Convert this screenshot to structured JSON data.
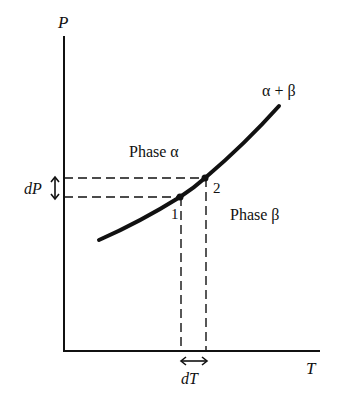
{
  "diagram": {
    "type": "phase-diagram",
    "axes": {
      "y_label": "P",
      "x_label": "T"
    },
    "regions": {
      "upper": "Phase α",
      "lower": "Phase β",
      "boundary": "α + β"
    },
    "points": [
      {
        "label": "1"
      },
      {
        "label": "2"
      }
    ],
    "increments": {
      "pressure": "dP",
      "temperature": "dT"
    },
    "colors": {
      "ink": "#111111",
      "background": "#ffffff"
    }
  }
}
